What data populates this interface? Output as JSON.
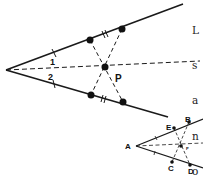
{
  "figure_main": {
    "labels": {
      "angle_1": "1",
      "angle_2": "2",
      "point_p": "P"
    }
  },
  "figure_small": {
    "labels": {
      "a": "A",
      "b": "B",
      "c": "C",
      "d": "D",
      "e": "E",
      "p": "P"
    }
  },
  "side_text": {
    "lines": [
      "L",
      "s",
      "a",
      "n",
      "o",
      "o",
      "li"
    ]
  }
}
